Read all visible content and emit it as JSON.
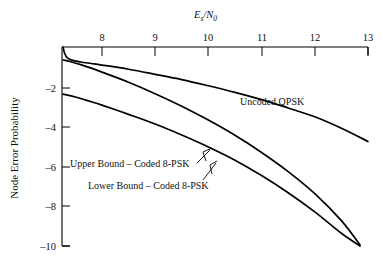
{
  "chart_data": {
    "type": "line",
    "title": "",
    "xlabel": "Es/N0",
    "xlabel_parts": {
      "main": "E",
      "sub": "s",
      "slash": "/",
      "main2": "N",
      "sub2": "0"
    },
    "ylabel": "Node Error Probability",
    "xlim": [
      7.25,
      13
    ],
    "ylim": [
      -10.0,
      -0.96
    ],
    "xticks": [
      8,
      9,
      10,
      11,
      12,
      13
    ],
    "xtick_labels": [
      "8",
      "9",
      "10",
      "11",
      "12",
      "13"
    ],
    "yticks": [
      -2,
      -4,
      -6,
      -8,
      -10
    ],
    "ytick_labels": [
      "–2",
      "–4",
      "–6",
      "–8",
      "–10"
    ],
    "grid": false,
    "legend_position": "inline-annotations",
    "xaxis_position": "top",
    "yaxis_position": "left",
    "series": [
      {
        "name": "Uncoded QPSK",
        "label": "Uncoded QPSK",
        "x": [
          7.27,
          7.3,
          7.35,
          7.45,
          7.6,
          7.8,
          8.0,
          8.5,
          9.0,
          9.5,
          10.0,
          10.5,
          11.0,
          11.5,
          12.0,
          12.5,
          13.0
        ],
        "y": [
          -0.96,
          -1.25,
          -1.45,
          -1.57,
          -1.64,
          -1.71,
          -1.78,
          -1.97,
          -2.2,
          -2.44,
          -2.72,
          -3.02,
          -3.35,
          -3.73,
          -4.13,
          -4.65,
          -5.25
        ]
      },
      {
        "name": "Upper Bound - Coded 8-PSK",
        "label": "Upper Bound – Coded 8-PSK",
        "x": [
          7.27,
          7.4,
          7.6,
          7.8,
          8.0,
          8.5,
          9.0,
          9.5,
          10.0,
          10.5,
          11.0,
          11.5,
          12.0,
          12.5,
          12.85
        ],
        "y": [
          -1.55,
          -1.62,
          -1.76,
          -1.92,
          -2.1,
          -2.56,
          -3.08,
          -3.65,
          -4.28,
          -4.97,
          -5.75,
          -6.62,
          -7.62,
          -8.85,
          -9.95
        ]
      },
      {
        "name": "Lower Bound - Coded 8-PSK",
        "label": "Lower Bound – Coded 8-PSK",
        "x": [
          7.27,
          7.5,
          7.8,
          8.0,
          8.5,
          9.0,
          9.5,
          10.0,
          10.5,
          11.0,
          11.5,
          12.0,
          12.5,
          12.85
        ],
        "y": [
          -3.1,
          -3.23,
          -3.45,
          -3.6,
          -4.02,
          -4.46,
          -4.96,
          -5.5,
          -6.1,
          -6.8,
          -7.58,
          -8.45,
          -9.42,
          -10.0
        ]
      }
    ],
    "annotations": [
      {
        "text": "Uncoded QPSK",
        "x": 10.65,
        "y": -2.3
      },
      {
        "text": "Upper Bound – Coded 8-PSK",
        "x": 7.4,
        "y": -6.07
      },
      {
        "text": "Lower Bound – Coded 8-PSK",
        "x": 7.95,
        "y": -7.05
      }
    ]
  },
  "axis": {
    "x_title_main": "E",
    "x_title_sub": "s",
    "x_title_slash": "/",
    "x_title_main2": "N",
    "x_title_sub2": "0",
    "y_title": "Node Error Probability"
  },
  "ticks": {
    "x": [
      "8",
      "9",
      "10",
      "11",
      "12",
      "13"
    ],
    "y": [
      "–2",
      "–4",
      "–6",
      "–8",
      "–10"
    ]
  },
  "labels": {
    "uncoded_qpsk": "Uncoded QPSK",
    "upper_bound": "Upper Bound – Coded 8-PSK",
    "lower_bound": "Lower Bound – Coded 8-PSK"
  }
}
